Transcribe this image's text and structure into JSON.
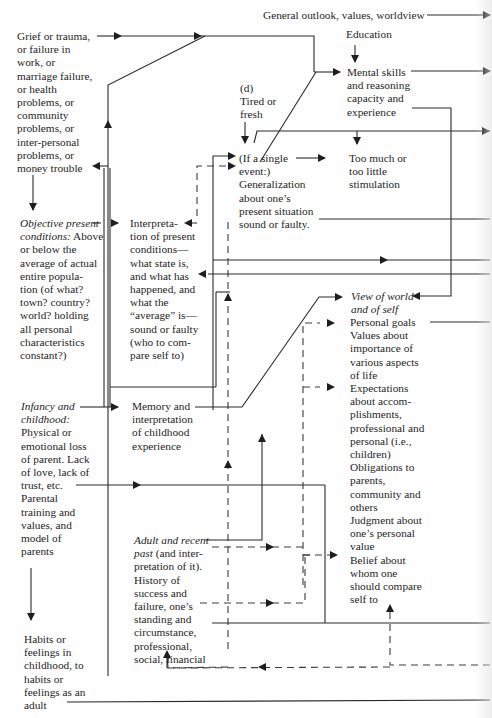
{
  "diagram": {
    "nodes": {
      "outlook": "General outlook, values, worldview",
      "grief": "Grief or trauma,\nor failure in\nwork, or\nmarriage failure,\nor health\nproblems, or\ncommunity\nproblems, or\ninter-personal\nproblems, or\nmoney trouble",
      "education": "Education",
      "mental_skills": "Mental skills\nand reasoning\ncapacity and\nexperience",
      "tired_label": "(d)\nTired or\nfresh",
      "single_event": "(If a single\nevent:)\nGeneralization\nabout one’s\npresent situation\nsound or faulty.",
      "stimulation": "Too much or\ntoo little\nstimulation",
      "objective_title": "Objective present\nconditions:",
      "objective_body": " Above\nor below the\naverage of actual\nentire popula-\ntion (of what?\ntown? country?\nworld? holding\nall personal\ncharacteristics\nconstant?)",
      "interpretation": "Interpreta-\ntion of present\nconditions—\nwhat state is,\nand what has\nhappened, and\nwhat the\n“average” is—\nsound or faulty\n(who to com-\npare self to)",
      "view_world": "View of world\nand of self",
      "personal_goals": "Personal goals\nValues about\nimportance of\nvarious aspects\nof life\nExpectations\nabout accom-\nplishments,\nprofessional and\npersonal (i.e.,\nchildren)\nObligations to\nparents,\ncommunity and\nothers\nJudgment about\none’s personal\nvalue\nBelief about\nwhom one\nshould compare\nself to",
      "infancy_title": "Infancy and\nchildhood:",
      "infancy_body": "Physical or\nemotional loss\nof parent. Lack\nof love, lack of\ntrust, etc.\nParental\ntraining and\nvalues, and\nmodel of\nparents",
      "memory": "Memory and\ninterpretation\nof childhood\nexperience",
      "adult_title": "Adult and recent\npast",
      "adult_body": "  (and inter-\npretation of it).\nHistory of\nsuccess and\nfailure, one’s\nstanding and\ncircumstance,\nprofessional,\nsocial, financial",
      "habits": "Habits or\nfeelings in\nchildhood, to\nhabits or\nfeelings as an\nadult"
    },
    "colors": {
      "line": "#2a2a2a",
      "text": "#1e1e1e",
      "background": "#fefefe"
    }
  }
}
